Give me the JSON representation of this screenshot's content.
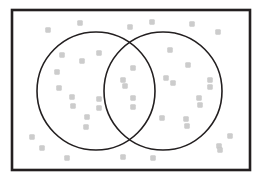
{
  "figure": {
    "width": 262,
    "height": 181,
    "background_color": "#ffffff"
  },
  "universe_rect": {
    "label": "universal-set-rectangle",
    "x": 12,
    "y": 10,
    "width": 238,
    "height": 160,
    "stroke_color": "#231f20",
    "stroke_width": 2.6,
    "fill": "none"
  },
  "circles": [
    {
      "label": "set-a-circle",
      "cx": 96,
      "cy": 91,
      "r": 59,
      "stroke_color": "#231f20",
      "stroke_width": 1.6,
      "fill": "none"
    },
    {
      "label": "set-b-circle",
      "cx": 163,
      "cy": 91,
      "r": 59,
      "stroke_color": "#231f20",
      "stroke_width": 1.6,
      "fill": "none"
    }
  ],
  "intersections": [
    {
      "label": "upper-intersection",
      "x": 130,
      "y": 48
    },
    {
      "label": "lower-intersection",
      "x": 130,
      "y": 135
    }
  ],
  "marker_style": {
    "shape": "square",
    "size": 5,
    "corner_radius": 0.8,
    "fill_color": "#cccccc",
    "stroke_color": "#c2c2c2",
    "stroke_width": 0.4
  },
  "chart_data": {
    "type": "scatter",
    "xlabel": "",
    "ylabel": "",
    "xlim": [
      12,
      250
    ],
    "ylim": [
      10,
      170
    ],
    "grid": false,
    "legend": "none",
    "regions": {
      "outside_both": 17,
      "only_a": 9,
      "only_b": 8,
      "both_a_and_b": 4,
      "total": 38
    },
    "series": [
      {
        "name": "elements",
        "marker": "square",
        "color": "#cccccc",
        "points": [
          {
            "x": 48,
            "y": 30,
            "region": "outside_both"
          },
          {
            "x": 80,
            "y": 23,
            "region": "outside_both"
          },
          {
            "x": 130,
            "y": 27,
            "region": "outside_both"
          },
          {
            "x": 152,
            "y": 22,
            "region": "outside_both"
          },
          {
            "x": 192,
            "y": 24,
            "region": "outside_both"
          },
          {
            "x": 218,
            "y": 32,
            "region": "outside_both"
          },
          {
            "x": 62,
            "y": 55,
            "region": "only_a"
          },
          {
            "x": 99,
            "y": 53,
            "region": "only_a"
          },
          {
            "x": 170,
            "y": 50,
            "region": "only_b"
          },
          {
            "x": 82,
            "y": 61,
            "region": "only_a"
          },
          {
            "x": 133,
            "y": 68,
            "region": "both_a_and_b"
          },
          {
            "x": 188,
            "y": 65,
            "region": "only_b"
          },
          {
            "x": 57,
            "y": 72,
            "region": "only_a"
          },
          {
            "x": 123,
            "y": 80,
            "region": "both_a_and_b"
          },
          {
            "x": 166,
            "y": 78,
            "region": "only_b"
          },
          {
            "x": 210,
            "y": 80,
            "region": "only_b"
          },
          {
            "x": 59,
            "y": 88,
            "region": "only_a"
          },
          {
            "x": 125,
            "y": 86,
            "region": "both_a_and_b"
          },
          {
            "x": 173,
            "y": 83,
            "region": "only_b"
          },
          {
            "x": 210,
            "y": 87,
            "region": "outside_both"
          },
          {
            "x": 72,
            "y": 97,
            "region": "only_a"
          },
          {
            "x": 99,
            "y": 99,
            "region": "only_a"
          },
          {
            "x": 133,
            "y": 98,
            "region": "both_a_and_b"
          },
          {
            "x": 199,
            "y": 98,
            "region": "only_b"
          },
          {
            "x": 73,
            "y": 106,
            "region": "only_a"
          },
          {
            "x": 99,
            "y": 108,
            "region": "only_a"
          },
          {
            "x": 133,
            "y": 107,
            "region": "both_a_and_b"
          },
          {
            "x": 200,
            "y": 105,
            "region": "only_b"
          },
          {
            "x": 87,
            "y": 117,
            "region": "only_a"
          },
          {
            "x": 162,
            "y": 118,
            "region": "only_b"
          },
          {
            "x": 186,
            "y": 119,
            "region": "only_b"
          },
          {
            "x": 86,
            "y": 127,
            "region": "only_a"
          },
          {
            "x": 187,
            "y": 126,
            "region": "only_b"
          },
          {
            "x": 32,
            "y": 137,
            "region": "outside_both"
          },
          {
            "x": 230,
            "y": 136,
            "region": "outside_both"
          },
          {
            "x": 42,
            "y": 148,
            "region": "outside_both"
          },
          {
            "x": 219,
            "y": 146,
            "region": "outside_both"
          },
          {
            "x": 67,
            "y": 158,
            "region": "outside_both"
          },
          {
            "x": 123,
            "y": 157,
            "region": "outside_both"
          },
          {
            "x": 153,
            "y": 158,
            "region": "outside_both"
          },
          {
            "x": 220,
            "y": 150,
            "region": "outside_both"
          }
        ]
      }
    ]
  }
}
